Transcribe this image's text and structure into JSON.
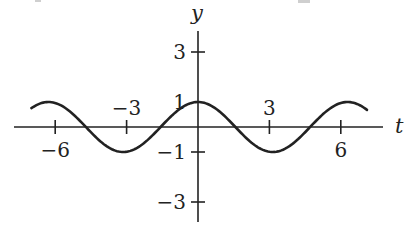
{
  "chart_data": {
    "type": "line",
    "title": "",
    "xlabel": "t",
    "ylabel": "y",
    "function": "y = cos(t)",
    "xlim": [
      -7.0,
      7.1
    ],
    "ylim": [
      -3.8,
      3.8
    ],
    "grid": false,
    "legend": null,
    "x_ticks": [
      {
        "value": -6,
        "label": "−6",
        "label_pos": "below"
      },
      {
        "value": -3,
        "label": "−3",
        "label_pos": "above"
      },
      {
        "value": 3,
        "label": "3",
        "label_pos": "above"
      },
      {
        "value": 6,
        "label": "6",
        "label_pos": "below"
      }
    ],
    "y_ticks": [
      {
        "value": 3,
        "label": "3"
      },
      {
        "value": 1,
        "label": "1"
      },
      {
        "value": -1,
        "label": "−1"
      },
      {
        "value": -3,
        "label": "−3"
      }
    ],
    "series": [
      {
        "name": "cos t",
        "x": [
          -7.0,
          -6.283,
          -4.712,
          -3.142,
          -1.571,
          0,
          1.571,
          3.142,
          4.712,
          6.283,
          7.1
        ],
        "values": [
          0.754,
          1,
          0,
          -1,
          0,
          1,
          0,
          -1,
          0,
          1,
          0.68
        ]
      }
    ]
  },
  "layout": {
    "origin_px": [
      198,
      127
    ],
    "px_per_unit_x": 23.8,
    "px_per_unit_y": 25,
    "x_axis_px": [
      14,
      383
    ],
    "y_axis_px": [
      31,
      222
    ],
    "curve_color": "#222222"
  }
}
